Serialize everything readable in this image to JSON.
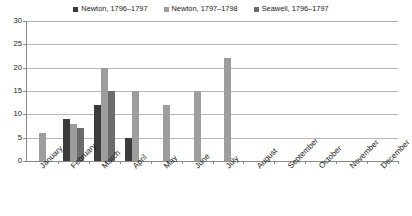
{
  "chart_data": {
    "type": "bar",
    "title": "",
    "subtitle": "",
    "xlabel": "",
    "ylabel": "",
    "ylim": [
      0,
      30
    ],
    "ytick_step": 5,
    "yticks": [
      0,
      5,
      10,
      15,
      20,
      25,
      30
    ],
    "ytick_labels": [
      "0",
      "5",
      "10",
      "15",
      "20",
      "25",
      "30"
    ],
    "grid": true,
    "grid_axis": "y",
    "legend_position": "top",
    "categories": [
      "January",
      "February",
      "March",
      "April",
      "May",
      "June",
      "July",
      "August",
      "September",
      "October",
      "November",
      "December"
    ],
    "series": [
      {
        "name": "Newton, 1796–1797",
        "color": "#3b3b3b",
        "values": [
          0,
          9,
          12,
          5,
          0,
          0,
          0,
          0,
          0,
          0,
          0,
          0
        ]
      },
      {
        "name": "Newton, 1797–1798",
        "color": "#9d9d9d",
        "values": [
          6,
          8,
          20,
          15,
          12,
          15,
          22,
          0,
          0,
          0,
          0,
          0
        ]
      },
      {
        "name": "Seawell, 1796–1797",
        "color": "#6b6b6b",
        "values": [
          0,
          7,
          15,
          0,
          0,
          0,
          0,
          0,
          0,
          0,
          0,
          0
        ]
      }
    ]
  },
  "legend": {
    "items": [
      {
        "label": "Newton, 1796–1797",
        "color": "#3b3b3b",
        "marker": "square-marker"
      },
      {
        "label": "Newton, 1797–1798",
        "color": "#9d9d9d",
        "marker": "square-marker"
      },
      {
        "label": "Seawell, 1796–1797",
        "color": "#6b6b6b",
        "marker": "square-marker"
      }
    ]
  },
  "colors": {
    "background": "#ffffff",
    "axis": "#8a8a8a",
    "gridline": "#b8b8b8",
    "text": "#1a1a1a"
  }
}
